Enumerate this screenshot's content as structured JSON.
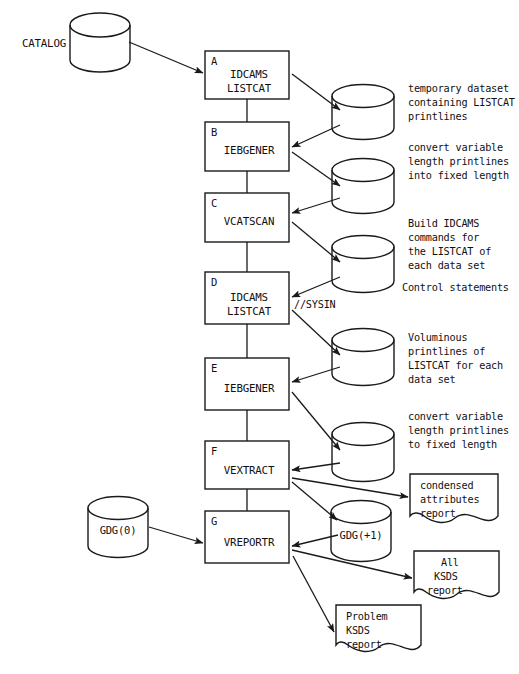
{
  "diagram": {
    "canvas": {
      "width": 519,
      "height": 674
    },
    "colors": {
      "stroke": "#1a1a1a",
      "background": "#ffffff",
      "text": "#111111"
    }
  },
  "datastores": [
    {
      "id": "catalog",
      "label": "CATALOG",
      "label_position": "left"
    },
    {
      "id": "tmp1",
      "label": "",
      "label_position": "none"
    },
    {
      "id": "tmp2",
      "label": "",
      "label_position": "none"
    },
    {
      "id": "ctl",
      "label": "",
      "label_position": "none"
    },
    {
      "id": "vol",
      "label": "",
      "label_position": "none"
    },
    {
      "id": "fixed",
      "label": "",
      "label_position": "none"
    },
    {
      "id": "gdg0",
      "label": "GDG(0)",
      "label_position": "inside"
    },
    {
      "id": "gdgplus1",
      "label": "GDG(+1)",
      "label_position": "inside"
    }
  ],
  "process_steps": [
    {
      "letter": "A",
      "lines": [
        "IDCAMS",
        "LISTCAT"
      ]
    },
    {
      "letter": "B",
      "lines": [
        "IEBGENER"
      ]
    },
    {
      "letter": "C",
      "lines": [
        "VCATSCAN"
      ]
    },
    {
      "letter": "D",
      "lines": [
        "IDCAMS",
        "LISTCAT"
      ]
    },
    {
      "letter": "E",
      "lines": [
        "IEBGENER"
      ]
    },
    {
      "letter": "F",
      "lines": [
        "VEXTRACT"
      ]
    },
    {
      "letter": "G",
      "lines": [
        "VREPORTR"
      ]
    }
  ],
  "side_notes": [
    {
      "id": "note-temp-dataset",
      "lines": [
        "temporary dataset",
        "containing LISTCAT",
        "printlines"
      ]
    },
    {
      "id": "note-convert-1",
      "lines": [
        "convert variable",
        "length printlines",
        "into fixed length"
      ]
    },
    {
      "id": "note-build-idcams",
      "lines": [
        "Build IDCAMS",
        "commands for",
        "the LISTCAT of",
        "each data set"
      ]
    },
    {
      "id": "note-control",
      "lines": [
        "Control statements"
      ]
    },
    {
      "id": "note-voluminous",
      "lines": [
        "Voluminous",
        "printlines of",
        "LISTCAT for each",
        "data set"
      ]
    },
    {
      "id": "note-convert-2",
      "lines": [
        "convert variable",
        "length printlines",
        "to fixed length"
      ]
    }
  ],
  "edge_labels": [
    {
      "id": "sysin",
      "text": "//SYSIN"
    }
  ],
  "documents": [
    {
      "id": "doc-condensed",
      "lines": [
        "condensed",
        "attributes",
        "report"
      ]
    },
    {
      "id": "doc-all-ksds",
      "lines": [
        "All",
        "KSDS",
        "report"
      ]
    },
    {
      "id": "doc-problem",
      "lines": [
        "Problem",
        "KSDS",
        "report"
      ]
    }
  ]
}
